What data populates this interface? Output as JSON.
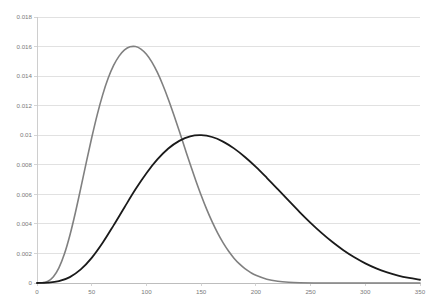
{
  "chart_data": {
    "type": "line",
    "title": "",
    "subtitle": "",
    "xlabel": "",
    "ylabel": "",
    "xlim": [
      0,
      350
    ],
    "ylim": [
      0,
      0.018
    ],
    "grid": true,
    "grid_axis": "y",
    "legend": "none",
    "xticks": [
      0,
      50,
      100,
      150,
      200,
      250,
      300,
      350
    ],
    "xtick_labels": [
      "0",
      "50",
      "100",
      "150",
      "200",
      "250",
      "300",
      "350"
    ],
    "yticks": [
      0,
      0.002,
      0.004,
      0.006,
      0.008,
      0.01,
      0.012,
      0.014,
      0.016,
      0.018
    ],
    "ytick_labels": [
      "0",
      "0.002",
      "0.004",
      "0.006",
      "0.008",
      "0.01",
      "0.012",
      "0.014",
      "0.016",
      "0.018"
    ],
    "series": [
      {
        "name": "gray-distribution",
        "color": "#808080",
        "linewidth": 1.6,
        "peak_x": 85,
        "peak_y": 0.016,
        "x": [
          0,
          5,
          10,
          15,
          20,
          25,
          30,
          35,
          40,
          45,
          50,
          55,
          60,
          65,
          70,
          75,
          80,
          85,
          90,
          95,
          100,
          105,
          110,
          115,
          120,
          125,
          130,
          135,
          140,
          145,
          150,
          155,
          160,
          165,
          170,
          175,
          180,
          185,
          190,
          195,
          200,
          210,
          220,
          230,
          240,
          260,
          280,
          300,
          320,
          350
        ],
        "values": [
          0,
          2e-05,
          0.00012,
          0.00042,
          0.00102,
          0.00196,
          0.00322,
          0.00474,
          0.00642,
          0.00815,
          0.00983,
          0.01138,
          0.01273,
          0.01385,
          0.01472,
          0.01535,
          0.01577,
          0.01598,
          0.016,
          0.01583,
          0.01548,
          0.01495,
          0.01425,
          0.0134,
          0.01244,
          0.01139,
          0.01028,
          0.00915,
          0.00803,
          0.00696,
          0.00594,
          0.005,
          0.00415,
          0.00339,
          0.00273,
          0.00216,
          0.00168,
          0.00129,
          0.00097,
          0.00072,
          0.00052,
          0.00026,
          0.00012,
          5e-05,
          2e-05,
          0.0,
          0.0,
          0.0,
          0.0,
          0.0
        ]
      },
      {
        "name": "black-distribution",
        "color": "#1a1a1a",
        "linewidth": 1.8,
        "peak_x": 150,
        "peak_y": 0.01,
        "x": [
          0,
          10,
          20,
          30,
          40,
          50,
          60,
          70,
          80,
          90,
          100,
          110,
          120,
          130,
          140,
          150,
          160,
          170,
          180,
          190,
          200,
          210,
          220,
          230,
          240,
          250,
          260,
          270,
          280,
          290,
          300,
          310,
          320,
          330,
          340,
          350
        ],
        "values": [
          0,
          2e-05,
          0.00012,
          0.0004,
          0.00092,
          0.0017,
          0.00272,
          0.0039,
          0.00513,
          0.00634,
          0.00743,
          0.00836,
          0.0091,
          0.00962,
          0.00993,
          0.01,
          0.00988,
          0.00957,
          0.00911,
          0.00853,
          0.00786,
          0.00712,
          0.00635,
          0.00557,
          0.0048,
          0.00407,
          0.00339,
          0.00277,
          0.00222,
          0.00174,
          0.00133,
          0.00099,
          0.00072,
          0.0005,
          0.00034,
          0.00022
        ]
      }
    ]
  },
  "plot_geometry": {
    "left": 37,
    "right": 420,
    "top": 17,
    "bottom": 283
  }
}
